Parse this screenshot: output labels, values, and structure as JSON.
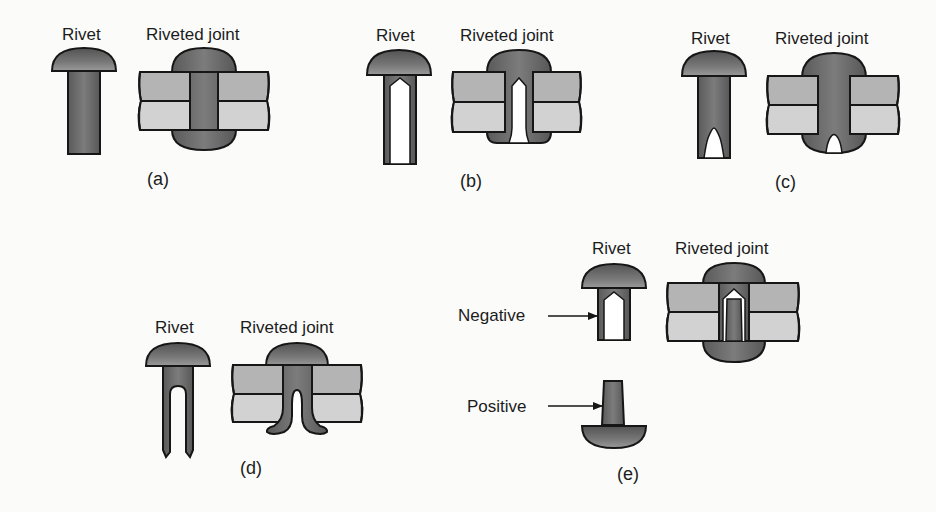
{
  "figure": {
    "colors": {
      "rivet_metal": "#6e6e6e",
      "rivet_metal_dark": "#4a4a4a",
      "plate_top": "#b4b4b4",
      "plate_bottom": "#d2d2d2",
      "outline": "#161616",
      "hollow": "#ffffff",
      "background": "#fbfbfa"
    },
    "panels": [
      {
        "id": "a",
        "caption": "(a)",
        "rivet_label": "Rivet",
        "joint_label": "Riveted joint",
        "rivet_type": "solid"
      },
      {
        "id": "b",
        "caption": "(b)",
        "rivet_label": "Rivet",
        "joint_label": "Riveted joint",
        "rivet_type": "tubular"
      },
      {
        "id": "c",
        "caption": "(c)",
        "rivet_label": "Rivet",
        "joint_label": "Riveted joint",
        "rivet_type": "semi-tubular"
      },
      {
        "id": "d",
        "caption": "(d)",
        "rivet_label": "Rivet",
        "joint_label": "Riveted joint",
        "rivet_type": "bifurcated"
      },
      {
        "id": "e",
        "caption": "(e)",
        "rivet_label": "Rivet",
        "joint_label": "Riveted joint",
        "rivet_type": "compression",
        "callouts": {
          "negative": "Negative",
          "positive": "Positive"
        }
      }
    ]
  }
}
